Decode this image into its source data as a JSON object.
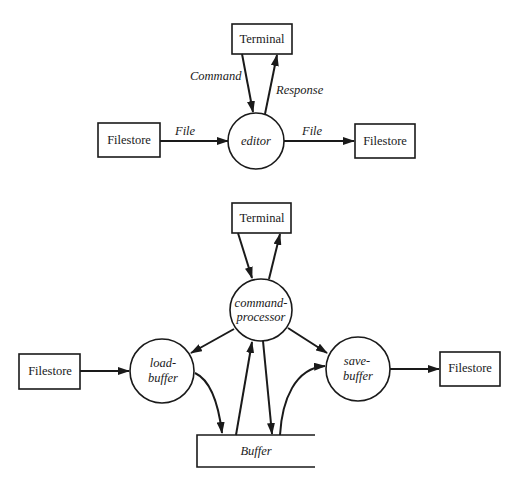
{
  "diagram": {
    "type": "data-flow-diagram",
    "top": {
      "terminal": {
        "label": "Terminal"
      },
      "process": {
        "label": "editor"
      },
      "source": {
        "label": "Filestore"
      },
      "sink": {
        "label": "Filestore"
      },
      "flows": {
        "command": "Command",
        "response": "Response",
        "file_in": "File",
        "file_out": "File"
      }
    },
    "bottom": {
      "terminal": {
        "label": "Terminal"
      },
      "command_processor": {
        "line1": "command-",
        "line2": "processor"
      },
      "load_buffer": {
        "line1": "load-",
        "line2": "buffer"
      },
      "save_buffer": {
        "line1": "save-",
        "line2": "buffer"
      },
      "source": {
        "label": "Filestore"
      },
      "sink": {
        "label": "Filestore"
      },
      "store": {
        "label": "Buffer"
      }
    }
  }
}
